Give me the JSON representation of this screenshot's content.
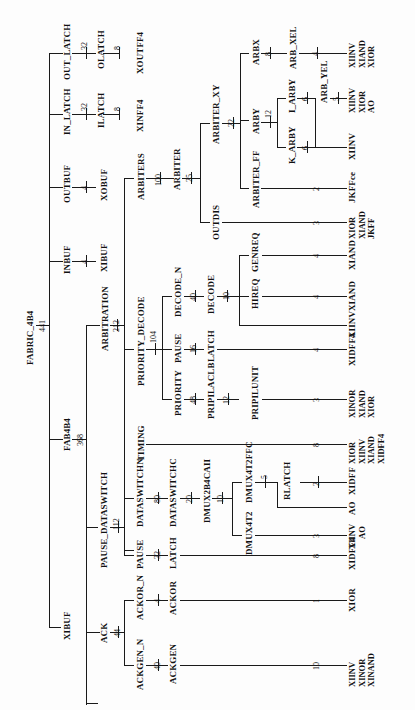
{
  "diagram": {
    "type": "hierarchy-tree",
    "orientation": "rotated-90-ccw",
    "root": {
      "name": "FABRIC_4B4",
      "count": "441"
    },
    "nodes": {
      "out_latch": {
        "name": "OUT_LATCH",
        "count": "32",
        "child": "OLATCH",
        "child_count": "8",
        "leaf": [
          "XOUTFF4"
        ]
      },
      "in_latch": {
        "name": "IN_LATCH",
        "count": "32",
        "child": "ILATCH",
        "child_count": "8",
        "leaf": [
          "XINFF4"
        ]
      },
      "outbuf": {
        "name": "OUTBUF",
        "count": "4",
        "leaf": [
          "XOBUF"
        ]
      },
      "inbuf": {
        "name": "INBUF",
        "count": "4",
        "leaf": [
          "XIBUF"
        ]
      },
      "fab4b4": {
        "name": "FAB4B4",
        "count": "368"
      },
      "xibuf": {
        "name": "XIBUF"
      },
      "arbitration": {
        "name": "ARBITRATION",
        "count": "212"
      },
      "arbiters": {
        "name": "ARBITERS",
        "count": "100"
      },
      "arbiter": {
        "name": "ARBITER",
        "count": "25"
      },
      "arbiter_xy": {
        "name": "ARBITER_XY",
        "count": "22"
      },
      "arbx": {
        "name": "ARBX",
        "count": "8",
        "child": "ARB_XEL",
        "child_count": "4",
        "leaf": [
          "XIINV",
          "XIAND",
          "XIOR"
        ]
      },
      "arby": {
        "name": "ARBY",
        "count": "12"
      },
      "i_arby": {
        "name": "I_ARBY",
        "count": "6",
        "child": "ARB_YEL",
        "child_count": "5",
        "leaf": [
          "XIINV",
          "XIOR",
          "AO"
        ]
      },
      "k_arby": {
        "name": "K_ARBY",
        "count": "6",
        "leaf": [
          "XIINV"
        ]
      },
      "arbiter_ff": {
        "name": "ARBITER_FF",
        "count": "2",
        "leaf": [
          "JKFFce"
        ]
      },
      "outdis": {
        "name": "OUTDIS",
        "count": "3",
        "leaf": [
          "XIOR",
          "XIAND",
          "JKFF"
        ]
      },
      "priority_decode": {
        "name": "PRIORITY_DECODE",
        "count": "104"
      },
      "decode_n": {
        "name": "DECODE_N",
        "count": "40"
      },
      "decode": {
        "name": "DECODE",
        "count": "10",
        "leaf": [
          "XIINV"
        ]
      },
      "genreq": {
        "name": "GENREQ",
        "count": "4",
        "leaf": [
          "XIAND"
        ]
      },
      "hireq": {
        "name": "HIREQ",
        "count": "4",
        "leaf": [
          "XIAND"
        ]
      },
      "pause_pd": {
        "name": "PAUSE",
        "count": "16",
        "child": "LATCH",
        "child_count": "4",
        "leaf": [
          "XIDFF4"
        ]
      },
      "priority": {
        "name": "PRIORITY",
        "count": "48",
        "child": "PRIPILACLB",
        "child_count": "12"
      },
      "pripilunit": {
        "name": "PRIPILUNIT",
        "count": "3",
        "leaf": [
          "XINOR",
          "XIAND",
          "XIOR"
        ]
      },
      "timing": {
        "name": "TIMING",
        "count": "8",
        "leaf": [
          "XIOR",
          "XIINV",
          "XIAND",
          "XIDFF4"
        ]
      },
      "pause_dataswitch": {
        "name": "PAUSE_DATASWITCH",
        "count": "112"
      },
      "dataswitchn": {
        "name": "DATASWITCHN",
        "count": "80",
        "child": "DATASWITCHC",
        "child_count": "20"
      },
      "dmux2b4cail": {
        "name": "DMUX2B4CAII",
        "count": "10"
      },
      "dmux4t2ffc": {
        "name": "DMUX4T2FFC",
        "count": "5",
        "leaf": [
          "AO"
        ]
      },
      "rlatch": {
        "name": "RLATCH",
        "count": "2",
        "leaf": [
          "XIDFF"
        ]
      },
      "dmux4t2": {
        "name": "DMUX4T2",
        "count": "3",
        "leaf": [
          "XIINV",
          "AO"
        ]
      },
      "pause_ps": {
        "name": "PAUSE",
        "count": "32",
        "child": "LATCH",
        "child_count": "8",
        "leaf": [
          "XIDFF4"
        ]
      },
      "ack": {
        "name": "ACK",
        "count": "44"
      },
      "ackor_n": {
        "name": "ACKOR_N",
        "count": "4",
        "child": "ACKOR",
        "child_count": "1",
        "leaf": [
          "XIOR"
        ]
      },
      "ackgen_n": {
        "name": "ACKGEN_N",
        "count": "40",
        "child": "ACKGEN",
        "child_count": "10",
        "leaf": [
          "XIINV",
          "XINOR",
          "XINAND"
        ]
      }
    }
  }
}
